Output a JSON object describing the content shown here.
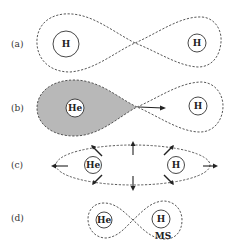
{
  "panels": [
    {
      "id": "a",
      "label": "(a)",
      "atoms": [
        {
          "symbol": "H",
          "role": "left"
        },
        {
          "symbol": "H",
          "role": "right"
        }
      ],
      "description": "Figure-eight dashed orbital spanning two H atoms"
    },
    {
      "id": "b",
      "label": "(b)",
      "atoms": [
        {
          "symbol": "He",
          "role": "left"
        },
        {
          "symbol": "H",
          "role": "right"
        }
      ],
      "description": "Shaded lobe around He with arrow pointing toward H lobe"
    },
    {
      "id": "c",
      "label": "(c)",
      "atoms": [
        {
          "symbol": "He",
          "role": "left"
        },
        {
          "symbol": "H",
          "role": "right"
        }
      ],
      "description": "Dashed ellipse enclosing He and H with outward arrows"
    },
    {
      "id": "d",
      "label": "(d)",
      "atoms": [
        {
          "symbol": "He",
          "role": "left"
        },
        {
          "symbol": "H",
          "role": "right"
        }
      ],
      "annotation": "MS",
      "description": "Small figure-eight around He and H labeled MS"
    }
  ],
  "colors": {
    "shaded_lobe": "#b8b8b8",
    "stroke": "#444444",
    "background": "#ffffff"
  }
}
